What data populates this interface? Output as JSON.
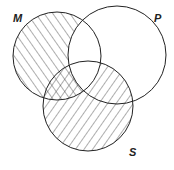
{
  "diagram": {
    "type": "venn",
    "sets": [
      {
        "id": "M",
        "label": "M"
      },
      {
        "id": "P",
        "label": "P"
      },
      {
        "id": "S",
        "label": "S"
      }
    ],
    "shading": {
      "M_only": "hatched",
      "M_and_S_not_P": "hatched",
      "S_not_M": "hatched",
      "M_and_P": "unshaded",
      "P_only": "unshaded"
    },
    "colors": {
      "line": "#222222",
      "background": "#ffffff"
    }
  }
}
